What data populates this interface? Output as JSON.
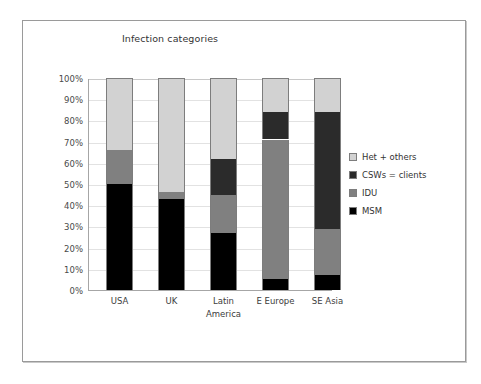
{
  "frame": {
    "present": true
  },
  "chart_data": {
    "type": "bar",
    "subtype": "stacked-100-percent",
    "title": "Infection categories",
    "xlabel": "",
    "ylabel": "",
    "ylim": [
      0,
      100
    ],
    "grid": true,
    "legend_position": "right",
    "categories": [
      "USA",
      "UK",
      "Latin America",
      "E Europe",
      "SE Asia"
    ],
    "category_lines": [
      [
        "USA"
      ],
      [
        "UK"
      ],
      [
        "Latin",
        "America"
      ],
      [
        "E Europe"
      ],
      [
        "SE Asia"
      ]
    ],
    "ytick_labels": [
      "100%",
      "90%",
      "80%",
      "70%",
      "60%",
      "50%",
      "40%",
      "30%",
      "20%",
      "10%",
      "0%"
    ],
    "ytick_values": [
      100,
      90,
      80,
      70,
      60,
      50,
      40,
      30,
      20,
      10,
      0
    ],
    "series": [
      {
        "name": "Het + others",
        "color": "#d2d2d2",
        "values": [
          34,
          54,
          38,
          16,
          16
        ]
      },
      {
        "name": "CSWs = clients",
        "color": "#2b2b2b",
        "values": [
          0,
          0,
          17,
          13,
          55
        ]
      },
      {
        "name": "IDU",
        "color": "#808080",
        "values": [
          16,
          3,
          18,
          66,
          22
        ]
      },
      {
        "name": "MSM",
        "color": "#000000",
        "values": [
          50,
          43,
          27,
          5,
          7
        ]
      }
    ],
    "stack_order_bottom_to_top": [
      "MSM",
      "IDU",
      "CSWs = clients",
      "Het + others"
    ],
    "stacked_segments": [
      {
        "category": "USA",
        "MSM": 50,
        "IDU": 16,
        "CSWs = clients": 0,
        "Het + others": 34
      },
      {
        "category": "UK",
        "MSM": 43,
        "IDU": 3,
        "CSWs = clients": 0,
        "Het + others": 54
      },
      {
        "category": "Latin America",
        "MSM": 27,
        "IDU": 18,
        "CSWs = clients": 17,
        "Het + others": 38
      },
      {
        "category": "E Europe",
        "MSM": 5,
        "IDU": 66,
        "CSWs = clients": 13,
        "Het + others": 16
      },
      {
        "category": "SE Asia",
        "MSM": 7,
        "IDU": 22,
        "CSWs = clients": 55,
        "Het + others": 16
      }
    ],
    "legend_entries": [
      {
        "label": "Het + others",
        "color": "#d2d2d2"
      },
      {
        "label": "CSWs = clients",
        "color": "#2b2b2b"
      },
      {
        "label": "IDU",
        "color": "#808080"
      },
      {
        "label": "MSM",
        "color": "#000000"
      }
    ]
  }
}
